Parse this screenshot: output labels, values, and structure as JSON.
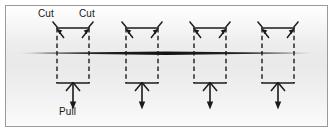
{
  "figure": {
    "background_top": "#ffffff",
    "background_mid": "#e9e9e9",
    "frame_color": "#9a9a9a",
    "ink_color": "#1a1a1a"
  },
  "labels": {
    "cut_left": "Cut",
    "cut_right": "Cut",
    "pull": "Pull"
  },
  "label_positions": {
    "cut_left": {
      "x": 37,
      "y": 7
    },
    "cut_right": {
      "x": 78,
      "y": 7
    },
    "pull": {
      "x": 57,
      "y": 105
    }
  },
  "main_line": {
    "name": "horizontal-sheet-line",
    "x1": 14,
    "x2": 312,
    "y": 47,
    "max_thickness": 3,
    "color": "#1a1a1a",
    "style": "tapered"
  },
  "units": [
    {
      "id": "unit-1",
      "center_x": 72,
      "labeled": true
    },
    {
      "id": "unit-2",
      "center_x": 141,
      "labeled": false
    },
    {
      "id": "unit-3",
      "center_x": 209,
      "labeled": false
    },
    {
      "id": "unit-4",
      "center_x": 277,
      "labeled": false
    }
  ],
  "unit_geometry": {
    "half_width": 16,
    "top_y": 22,
    "bottom_y": 77,
    "pull_stem_end_y": 109,
    "side_style": "dashed",
    "top_bar_style": "solid",
    "bottom_bar_style": "solid",
    "corner_tick_length": 9,
    "corner_arrow_length": 10
  },
  "legend": {
    "cut_marks": "diagonal dashed tick at each upper corner",
    "corner_arrows": "arrowheads pointing up and outward at box top corners",
    "pull_arrow": "arrowhead pointing up into bottom bar with stem descending to a downward arrow"
  }
}
